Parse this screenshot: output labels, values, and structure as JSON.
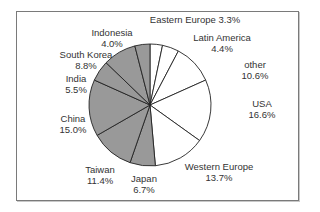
{
  "chart_data": {
    "type": "pie",
    "title": "",
    "start_angle_deg": 0,
    "direction": "clockwise",
    "slices": [
      {
        "label": "Eastern Europe",
        "value": 3.3,
        "display": "3.3%",
        "fill": "#ffffff",
        "label_pos": [
          195,
          14
        ],
        "inline": true
      },
      {
        "label": "Latin America",
        "value": 4.4,
        "display": "4.4%",
        "fill": "#ffffff",
        "label_pos": [
          222,
          32
        ]
      },
      {
        "label": "other",
        "value": 10.6,
        "display": "10.6%",
        "fill": "#ffffff",
        "label_pos": [
          255,
          59
        ]
      },
      {
        "label": "USA",
        "value": 16.6,
        "display": "16.6%",
        "fill": "#ffffff",
        "label_pos": [
          262,
          98
        ]
      },
      {
        "label": "Western Europe",
        "value": 13.7,
        "display": "13.7%",
        "fill": "#ffffff",
        "label_pos": [
          219,
          161
        ]
      },
      {
        "label": "Japan",
        "value": 6.7,
        "display": "6.7%",
        "fill": "#999999",
        "label_pos": [
          144,
          173
        ]
      },
      {
        "label": "Taiwan",
        "value": 11.4,
        "display": "11.4%",
        "fill": "#999999",
        "label_pos": [
          100,
          164
        ]
      },
      {
        "label": "China",
        "value": 15.0,
        "display": "15.0%",
        "fill": "#999999",
        "label_pos": [
          73,
          113
        ]
      },
      {
        "label": "India",
        "value": 5.5,
        "display": "5.5%",
        "fill": "#999999",
        "label_pos": [
          76,
          73
        ]
      },
      {
        "label": "South Korea",
        "value": 8.8,
        "display": "8.8%",
        "fill": "#999999",
        "label_pos": [
          86,
          49
        ]
      },
      {
        "label": "Indonesia",
        "value": 4.0,
        "display": "4.0%",
        "fill": "#999999",
        "label_pos": [
          112,
          27
        ]
      }
    ],
    "center": [
      150,
      105
    ],
    "radius": 61,
    "stroke": "#222222",
    "legend": "none"
  }
}
